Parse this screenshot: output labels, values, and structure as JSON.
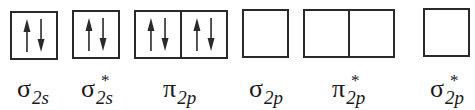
{
  "diagram": {
    "title": "",
    "colors": {
      "line": "#2a2a2a",
      "text": "#1a1a1a",
      "background": "#ffffff"
    },
    "orbitals": [
      {
        "id": "sigma-2s",
        "greek": "σ",
        "star": "",
        "subscript": "2s",
        "cells": [
          {
            "electrons": [
              "up",
              "down"
            ]
          }
        ]
      },
      {
        "id": "sigma-star-2s",
        "greek": "σ",
        "star": "*",
        "subscript": "2s",
        "cells": [
          {
            "electrons": [
              "up",
              "down"
            ]
          }
        ]
      },
      {
        "id": "pi-2p",
        "greek": "π",
        "star": "",
        "subscript": "2p",
        "cells": [
          {
            "electrons": [
              "up",
              "down"
            ]
          },
          {
            "electrons": [
              "up",
              "down"
            ]
          }
        ]
      },
      {
        "id": "sigma-2p",
        "greek": "σ",
        "star": "",
        "subscript": "2p",
        "cells": [
          {
            "electrons": []
          }
        ]
      },
      {
        "id": "pi-star-2p",
        "greek": "π",
        "star": "*",
        "subscript": "2p",
        "cells": [
          {
            "electrons": []
          },
          {
            "electrons": []
          }
        ]
      },
      {
        "id": "sigma-star-2p",
        "greek": "σ",
        "star": "*",
        "subscript": "2p",
        "cells": [
          {
            "electrons": []
          }
        ]
      }
    ]
  }
}
